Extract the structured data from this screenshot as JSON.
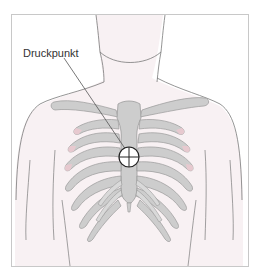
{
  "figure": {
    "label": "Druckpunkt",
    "colors": {
      "frame": "#c8c8c8",
      "outline": "#7a7a7a",
      "skin": "#f8f1f3",
      "bone": "#cdcdcd",
      "bone_edge": "#9a9a9a",
      "cartilage_tint": "#e7c9cf",
      "marker": "#222222"
    },
    "marker": {
      "type": "crosshair-circle",
      "cx": 129,
      "cy": 157,
      "r": 10
    }
  }
}
